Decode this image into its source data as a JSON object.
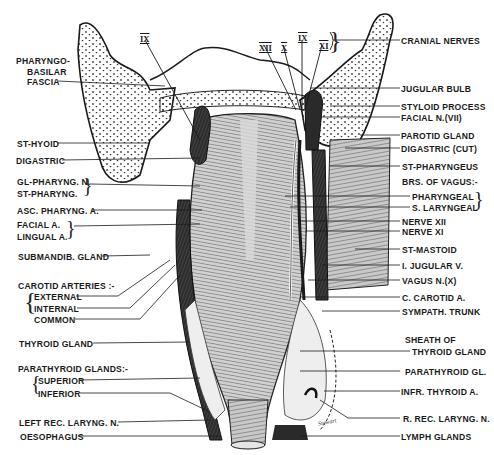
{
  "figure": {
    "signature": "Stewart"
  },
  "cranial_nerve_numerals": [
    {
      "id": "ix_left",
      "text": "IX"
    },
    {
      "id": "xii",
      "text": "XII"
    },
    {
      "id": "x",
      "text": "X"
    },
    {
      "id": "ix_right",
      "text": "IX"
    },
    {
      "id": "xi",
      "text": "XI"
    }
  ],
  "left_labels": {
    "pharyngobasilar_fascia": [
      "PHARYNGO-",
      "BASILAR",
      "FASCIA"
    ],
    "st_hyoid": "ST-HYOID",
    "digastric": "DIGASTRIC",
    "gl_pharyng_n": "GL-PHARYNG. N.",
    "st_pharyng": "ST-PHARYNG.",
    "asc_pharyng_a": "ASC. PHARYNG. A.",
    "facial_a": "FACIAL A.",
    "lingual_a": "LINGUAL A.",
    "submandib_gland": "SUBMANDIB. GLAND",
    "carotid_arteries_heading": "CAROTID ARTERIES :-",
    "carotid_external": "EXTERNAL",
    "carotid_internal": "INTERNAL",
    "carotid_common": "COMMON",
    "thyroid_gland": "THYROID GLAND",
    "parathyroid_heading": "PARATHYROID GLANDS:-",
    "parathyroid_superior": "SUPERIOR",
    "parathyroid_inferior": "INFERIOR",
    "left_rec_laryng_n": "LEFT REC. LARYNG. N.",
    "oesophagus": "OESOPHAGUS"
  },
  "right_labels": {
    "cranial_nerves": "CRANIAL NERVES",
    "jugular_bulb": "JUGULAR BULB",
    "styloid_process": "STYLOID PROCESS",
    "facial_n": "FACIAL N.(VII)",
    "parotid_gland": "PAROTID GLAND",
    "digastric_cut": "DIGASTRIC (CUT)",
    "st_pharyngeus": "ST-PHARYNGEUS",
    "brs_of_vagus": "BRS. OF VAGUS:-",
    "pharyngeal": "PHARYNGEAL",
    "s_laryngeal": "S. LARYNGEAL",
    "nerve_xii": "NERVE XII",
    "nerve_xi": "NERVE XI",
    "st_mastoid": "ST-MASTOID",
    "i_jugular_v": "I. JUGULAR V.",
    "vagus_n": "VAGUS N.(X)",
    "c_carotid_a": "C. CAROTID A.",
    "sympath_trunk": "SYMPATH. TRUNK",
    "sheath_of": "SHEATH OF",
    "thyroid_gland_sheath": "THYROID GLAND",
    "parathyroid_gl": "PARATHYROID GL.",
    "infr_thyroid_a": "INFR. THYROID A.",
    "r_rec_laryng_n": "R. REC. LARYNG. N.",
    "lymph_glands": "LYMPH GLANDS"
  },
  "colors": {
    "ink": "#1a1a1a",
    "muscle_gray": "#b8b8b8",
    "vessel_dark": "#2a2a2a",
    "background": "#ffffff"
  }
}
